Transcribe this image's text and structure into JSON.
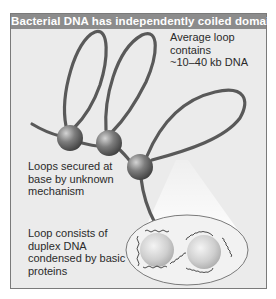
{
  "figure": {
    "title": "Bacterial DNA has independently coiled domains",
    "labels": {
      "average_loop": [
        "Average loop",
        "contains",
        "~10–40 kb DNA"
      ],
      "loops_secured": [
        "Loops secured at",
        "base by unknown",
        "mechanism"
      ],
      "loop_consists": [
        "Loop consists of",
        "duplex DNA",
        "condensed by basic",
        "proteins"
      ]
    },
    "colors": {
      "header_bg": "#8c8c8c",
      "panel_bg": "#ebebeb",
      "dna_strand": "#555555",
      "sphere": "#7a7a7a",
      "protein_sphere": "#c8c8c8"
    }
  }
}
